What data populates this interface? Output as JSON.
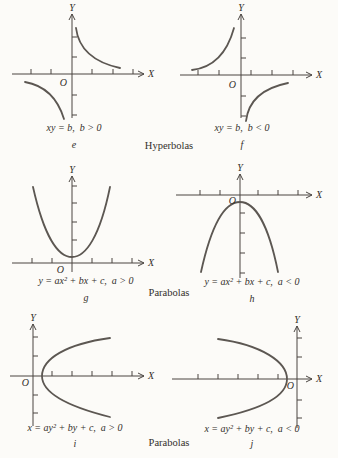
{
  "colors": {
    "ink": "#332f2b",
    "axis": "#4a4541",
    "curve": "#5c5752",
    "bg": "#fcfbf8"
  },
  "axis_labels": {
    "x": "X",
    "y": "Y",
    "origin": "O"
  },
  "groups": {
    "row1": "Hyperbolas",
    "row2": "Parabolas",
    "row3": "Parabolas"
  },
  "panels": {
    "e": {
      "caption": "xy = b,  b > 0",
      "letter": "e",
      "curve": "hyperbola, branches in first and third quadrants"
    },
    "f": {
      "caption": "xy = b,  b < 0",
      "letter": "f",
      "curve": "hyperbola, branches in second and fourth quadrants"
    },
    "g": {
      "caption": "y = ax² + bx + c,  a > 0",
      "letter": "g",
      "curve": "parabola opening upward, vertex just above origin"
    },
    "h": {
      "caption": "y = ax² + bx + c,  a < 0",
      "letter": "h",
      "curve": "parabola opening downward, vertex just below origin"
    },
    "i": {
      "caption": "x = ay² + by + c,  a > 0",
      "letter": "i",
      "curve": "parabola opening rightward, vertex just right of origin"
    },
    "j": {
      "caption": "x = ay² + by + c,  a < 0",
      "letter": "j",
      "curve": "parabola opening leftward, vertex just left of origin"
    }
  }
}
